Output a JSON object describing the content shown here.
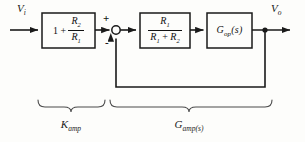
{
  "figure": {
    "type": "control-system-block-diagram",
    "line_color": "#1a1a1a",
    "background": "#fdfdfb"
  },
  "signals": {
    "input": {
      "symbol": "V",
      "subscript": "i",
      "full": "Vi"
    },
    "output": {
      "symbol": "V",
      "subscript": "o",
      "full": "Vo"
    }
  },
  "summing_junction": {
    "name": "summing-junction",
    "plus_sign": "+",
    "minus_sign": "-",
    "plus_input": "forward path from Kamp",
    "minus_input": "feedback path from output"
  },
  "blocks": [
    {
      "id": "kamp-block",
      "lead_term": "1 +",
      "fraction": {
        "numerator": "R",
        "numerator_sub": "2",
        "denominator": "R",
        "denominator_sub": "1"
      },
      "text": "1 + R2/R1"
    },
    {
      "id": "feedback-gain-block",
      "lead_term": "",
      "fraction": {
        "numerator": "R",
        "numerator_sub": "1",
        "denominator": "R1 + R2",
        "denominator_sub": ""
      },
      "text": "R1/(R1 + R2)"
    },
    {
      "id": "op-amp-gain-block",
      "label": "Gop(s)",
      "label_main": "G",
      "label_sub": "op",
      "label_tail": "(s)",
      "text": "Gop(s)"
    }
  ],
  "braces": [
    {
      "id": "kamp-brace",
      "caption_main": "K",
      "caption_sub": "amp",
      "caption": "Kamp"
    },
    {
      "id": "gamp-brace",
      "caption_main": "G",
      "caption_sub": "amp(s)",
      "caption": "Gamp(s)"
    }
  ],
  "branch_point": {
    "name": "output-branch-node"
  },
  "feedback_path": {
    "direction": "right-to-left, then up into summing junction"
  }
}
